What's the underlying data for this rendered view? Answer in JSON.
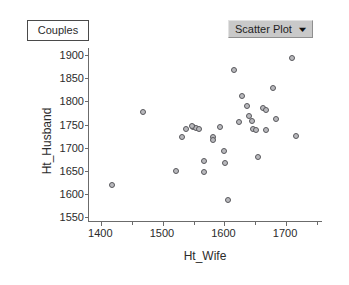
{
  "window": {
    "title": "Couples"
  },
  "title_box": {
    "label": "Couples"
  },
  "dropdown": {
    "selected": "Scatter Plot",
    "caret": "▼",
    "options": [
      "Scatter Plot"
    ]
  },
  "chart_data": {
    "type": "scatter",
    "title": "Couples",
    "xlabel": "Ht_Wife",
    "ylabel": "Ht_Husband",
    "xlim": [
      1380,
      1760
    ],
    "ylim": [
      1540,
      1915
    ],
    "xticks": [
      1400,
      1500,
      1600,
      1700
    ],
    "yticks": [
      1550,
      1600,
      1650,
      1700,
      1750,
      1800,
      1850,
      1900
    ],
    "x_minor_step": 50,
    "grid": false,
    "legend": null,
    "marker": {
      "shape": "circle",
      "fill": "#b9b9bd",
      "edge": "#58585c",
      "size": 6
    },
    "n_points": 33,
    "points": [
      {
        "x": 1417,
        "y": 1620
      },
      {
        "x": 1468,
        "y": 1776
      },
      {
        "x": 1521,
        "y": 1649
      },
      {
        "x": 1531,
        "y": 1723
      },
      {
        "x": 1537,
        "y": 1740
      },
      {
        "x": 1549,
        "y": 1744
      },
      {
        "x": 1554,
        "y": 1743
      },
      {
        "x": 1559,
        "y": 1741
      },
      {
        "x": 1566,
        "y": 1672
      },
      {
        "x": 1567,
        "y": 1647
      },
      {
        "x": 1581,
        "y": 1724
      },
      {
        "x": 1581,
        "y": 1717
      },
      {
        "x": 1593,
        "y": 1745
      },
      {
        "x": 1600,
        "y": 1692
      },
      {
        "x": 1601,
        "y": 1668
      },
      {
        "x": 1606,
        "y": 1588
      },
      {
        "x": 1615,
        "y": 1868
      },
      {
        "x": 1623,
        "y": 1756
      },
      {
        "x": 1629,
        "y": 1811
      },
      {
        "x": 1637,
        "y": 1790
      },
      {
        "x": 1640,
        "y": 1768
      },
      {
        "x": 1644,
        "y": 1757
      },
      {
        "x": 1647,
        "y": 1741
      },
      {
        "x": 1651,
        "y": 1739
      },
      {
        "x": 1655,
        "y": 1680
      },
      {
        "x": 1663,
        "y": 1786
      },
      {
        "x": 1667,
        "y": 1781
      },
      {
        "x": 1668,
        "y": 1739
      },
      {
        "x": 1678,
        "y": 1828
      },
      {
        "x": 1684,
        "y": 1763
      },
      {
        "x": 1709,
        "y": 1893
      },
      {
        "x": 1716,
        "y": 1725
      },
      {
        "x": 1548,
        "y": 1746
      }
    ]
  }
}
